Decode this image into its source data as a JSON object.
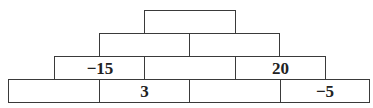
{
  "pyramid": {
    "rows": [
      {
        "cells": [
          ""
        ]
      },
      {
        "cells": [
          "",
          ""
        ]
      },
      {
        "cells": [
          "−15",
          "",
          "20"
        ]
      },
      {
        "cells": [
          "",
          "3",
          "",
          "−5"
        ]
      }
    ]
  },
  "colors": {
    "border": "#3a3a3a",
    "text": "#222222",
    "background": "#ffffff"
  }
}
